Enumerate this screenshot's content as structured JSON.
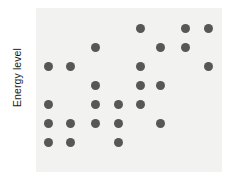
{
  "axes": {
    "y_label": "Energy level",
    "x_label": ""
  },
  "style": {
    "panel_background": "#f2f2f0",
    "figure_background": "#ffffff",
    "dot_color": "#575757",
    "label_color": "#1b1b1b"
  },
  "chart_data": {
    "type": "scatter",
    "title": "",
    "xlabel": "",
    "ylabel": "Energy level",
    "grid": false,
    "legend": false,
    "xlim": [
      0.5,
      8.5
    ],
    "ylim": [
      0.5,
      7.5
    ],
    "xticklabels": [],
    "yticklabels": [],
    "marker": "circle",
    "marker_size": 9,
    "columns": [
      1,
      2,
      3,
      4,
      5,
      6,
      7,
      8
    ],
    "rows": [
      7,
      6,
      5,
      4,
      3,
      2,
      1
    ],
    "rows_top_to_bottom": [
      {
        "row": 7,
        "columns": [
          5,
          7,
          8
        ],
        "count": 3
      },
      {
        "row": 6,
        "columns": [
          3,
          6,
          7
        ],
        "count": 3
      },
      {
        "row": 5,
        "columns": [
          1,
          2,
          5,
          8
        ],
        "count": 4
      },
      {
        "row": 4,
        "columns": [
          3,
          5,
          6
        ],
        "count": 3
      },
      {
        "row": 3,
        "columns": [
          1,
          3,
          4,
          5
        ],
        "count": 4
      },
      {
        "row": 2,
        "columns": [
          1,
          2,
          3,
          4,
          6
        ],
        "count": 5
      },
      {
        "row": 1,
        "columns": [
          1,
          2,
          4
        ],
        "count": 3
      }
    ],
    "points": [
      {
        "x": 5,
        "y": 7
      },
      {
        "x": 7,
        "y": 7
      },
      {
        "x": 8,
        "y": 7
      },
      {
        "x": 3,
        "y": 6
      },
      {
        "x": 6,
        "y": 6
      },
      {
        "x": 7,
        "y": 6
      },
      {
        "x": 1,
        "y": 5
      },
      {
        "x": 2,
        "y": 5
      },
      {
        "x": 5,
        "y": 5
      },
      {
        "x": 8,
        "y": 5
      },
      {
        "x": 3,
        "y": 4
      },
      {
        "x": 5,
        "y": 4
      },
      {
        "x": 6,
        "y": 4
      },
      {
        "x": 1,
        "y": 3
      },
      {
        "x": 3,
        "y": 3
      },
      {
        "x": 4,
        "y": 3
      },
      {
        "x": 5,
        "y": 3
      },
      {
        "x": 1,
        "y": 2
      },
      {
        "x": 2,
        "y": 2
      },
      {
        "x": 3,
        "y": 2
      },
      {
        "x": 4,
        "y": 2
      },
      {
        "x": 6,
        "y": 2
      },
      {
        "x": 1,
        "y": 1
      },
      {
        "x": 2,
        "y": 1
      },
      {
        "x": 4,
        "y": 1
      }
    ],
    "total_points": 25,
    "pixel_geometry": {
      "panel_left": 36,
      "panel_top": 8,
      "panel_width": 186,
      "panel_height": 164,
      "column_x": [
        48,
        70,
        95,
        118,
        140,
        160,
        185,
        208
      ],
      "row_y": [
        28,
        47,
        66,
        85,
        104,
        123,
        142
      ]
    }
  }
}
